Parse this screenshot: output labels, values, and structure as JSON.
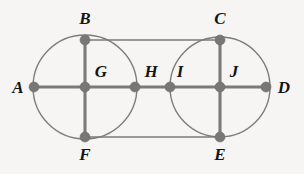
{
  "diagram": {
    "type": "graph",
    "canvas": {
      "width": 304,
      "height": 174,
      "background": "#f6f5f3"
    },
    "style": {
      "node_color": "#777777",
      "edge_color": "#7a7a7a",
      "arc_color": "#7d7d7d",
      "label_color": "#141414",
      "thin_edge_width": 1.4,
      "thick_edge_width": 3.1,
      "node_radius": 5
    },
    "circles": [
      {
        "name": "left-circle",
        "cx": 85,
        "cy": 87,
        "r": 52
      },
      {
        "name": "right-circle",
        "cx": 220,
        "cy": 87,
        "r": 50
      }
    ],
    "vertices": [
      {
        "id": "A",
        "label": "A",
        "x": 34,
        "y": 87,
        "label_x": 18,
        "label_y": 93
      },
      {
        "id": "B",
        "label": "B",
        "x": 85,
        "y": 40,
        "label_x": 85,
        "label_y": 24
      },
      {
        "id": "C",
        "label": "C",
        "x": 220,
        "y": 40,
        "label_x": 220,
        "label_y": 24
      },
      {
        "id": "D",
        "label": "D",
        "x": 266,
        "y": 87,
        "label_x": 284,
        "label_y": 93
      },
      {
        "id": "E",
        "label": "E",
        "x": 220,
        "y": 137,
        "label_x": 220,
        "label_y": 157
      },
      {
        "id": "F",
        "label": "F",
        "x": 85,
        "y": 137,
        "label_x": 85,
        "label_y": 157
      },
      {
        "id": "G",
        "label": "G",
        "x": 85,
        "y": 87,
        "label_x": 101,
        "label_y": 77
      },
      {
        "id": "H",
        "label": "H",
        "x": 135,
        "y": 87,
        "label_x": 151,
        "label_y": 77
      },
      {
        "id": "I",
        "label": "I",
        "x": 170,
        "y": 87,
        "label_x": 180,
        "label_y": 77
      },
      {
        "id": "J",
        "label": "J",
        "x": 220,
        "y": 87,
        "label_x": 234,
        "label_y": 77
      }
    ],
    "edges": [
      {
        "from": "A",
        "to": "G",
        "kind": "straight",
        "weight": "thick"
      },
      {
        "from": "G",
        "to": "H",
        "kind": "straight",
        "weight": "thick"
      },
      {
        "from": "H",
        "to": "I",
        "kind": "straight",
        "weight": "thick"
      },
      {
        "from": "I",
        "to": "J",
        "kind": "straight",
        "weight": "thick"
      },
      {
        "from": "J",
        "to": "D",
        "kind": "straight",
        "weight": "thick"
      },
      {
        "from": "B",
        "to": "G",
        "kind": "straight",
        "weight": "thick"
      },
      {
        "from": "G",
        "to": "F",
        "kind": "straight",
        "weight": "thick"
      },
      {
        "from": "C",
        "to": "J",
        "kind": "straight",
        "weight": "thick"
      },
      {
        "from": "J",
        "to": "E",
        "kind": "straight",
        "weight": "thick"
      },
      {
        "from": "B",
        "to": "C",
        "kind": "straight",
        "weight": "thin"
      },
      {
        "from": "F",
        "to": "E",
        "kind": "straight",
        "weight": "thin"
      },
      {
        "from": "A",
        "to": "B",
        "kind": "arc",
        "weight": "thin"
      },
      {
        "from": "B",
        "to": "H",
        "kind": "arc",
        "weight": "thin"
      },
      {
        "from": "H",
        "to": "F",
        "kind": "arc",
        "weight": "thin"
      },
      {
        "from": "F",
        "to": "A",
        "kind": "arc",
        "weight": "thin"
      },
      {
        "from": "I",
        "to": "C",
        "kind": "arc",
        "weight": "thin"
      },
      {
        "from": "C",
        "to": "D",
        "kind": "arc",
        "weight": "thin"
      },
      {
        "from": "D",
        "to": "E",
        "kind": "arc",
        "weight": "thin"
      },
      {
        "from": "E",
        "to": "I",
        "kind": "arc",
        "weight": "thin"
      }
    ]
  }
}
